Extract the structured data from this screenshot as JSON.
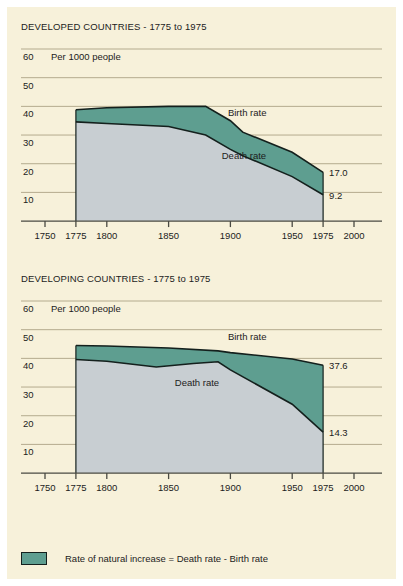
{
  "panel": {
    "background_color": "#f7f1da",
    "page_background_color": "#ffffff"
  },
  "colors": {
    "natural_increase_fill": "#5e9e90",
    "death_area_fill": "#c8ced2",
    "line": "#14201d",
    "gridline": "#b4ab8e",
    "axis": "#4a4a42",
    "text": "#1c1c1c"
  },
  "legend": {
    "swatch_name": "natural-increase-swatch",
    "text": "Rate of natural increase = Death rate - Birth rate"
  },
  "charts": [
    {
      "id": "developed",
      "title": "DEVELOPED COUNTRIES - 1775 to 1975",
      "unit_label": "Per 1000 people",
      "birth_label": "Birth rate",
      "death_label": "Death rate",
      "end_label_birth": "17.0",
      "end_label_death": "9.2",
      "y_ticks": [
        60,
        50,
        40,
        30,
        20,
        10
      ],
      "x_ticks": [
        1750,
        1775,
        1800,
        1850,
        1900,
        1950,
        1975,
        2000
      ],
      "xlim": [
        1750,
        2000
      ],
      "ylim": [
        0,
        63
      ],
      "series": [
        {
          "name": "Birth rate",
          "points": [
            [
              1775,
              38.8
            ],
            [
              1800,
              39.5
            ],
            [
              1850,
              40.0
            ],
            [
              1880,
              40.0
            ],
            [
              1900,
              35.0
            ],
            [
              1910,
              31.0
            ],
            [
              1950,
              24.0
            ],
            [
              1975,
              17.0
            ]
          ]
        },
        {
          "name": "Death rate",
          "points": [
            [
              1775,
              34.6
            ],
            [
              1800,
              34.0
            ],
            [
              1850,
              33.0
            ],
            [
              1880,
              30.0
            ],
            [
              1900,
              25.0
            ],
            [
              1910,
              22.8
            ],
            [
              1950,
              15.5
            ],
            [
              1975,
              9.2
            ]
          ]
        }
      ]
    },
    {
      "id": "developing",
      "title": "DEVELOPING COUNTRIES - 1775 to 1975",
      "unit_label": "Per 1000 people",
      "birth_label": "Birth rate",
      "death_label": "Death rate",
      "end_label_birth": "37.6",
      "end_label_death": "14.3",
      "y_ticks": [
        60,
        50,
        40,
        30,
        20,
        10
      ],
      "x_ticks": [
        1750,
        1775,
        1800,
        1850,
        1900,
        1950,
        1975,
        2000
      ],
      "xlim": [
        1750,
        2000
      ],
      "ylim": [
        0,
        63
      ],
      "series": [
        {
          "name": "Birth rate",
          "points": [
            [
              1775,
              44.5
            ],
            [
              1800,
              44.3
            ],
            [
              1850,
              43.6
            ],
            [
              1890,
              42.6
            ],
            [
              1900,
              42.0
            ],
            [
              1950,
              39.8
            ],
            [
              1975,
              37.6
            ]
          ]
        },
        {
          "name": "Death rate",
          "points": [
            [
              1775,
              39.6
            ],
            [
              1800,
              39.0
            ],
            [
              1840,
              37.0
            ],
            [
              1870,
              38.2
            ],
            [
              1890,
              38.8
            ],
            [
              1900,
              36.0
            ],
            [
              1950,
              24.0
            ],
            [
              1975,
              14.3
            ]
          ]
        }
      ]
    }
  ],
  "chart_data": {
    "type": "area",
    "ylabel": "Per 1000 people",
    "xlabel": "",
    "xlim": [
      1750,
      2000
    ],
    "ylim": [
      0,
      63
    ],
    "grid": true,
    "legend": "Rate of natural increase = Death rate - Birth rate",
    "panels": [
      {
        "title": "DEVELOPED COUNTRIES - 1775 to 1975",
        "x": [
          1775,
          1800,
          1850,
          1880,
          1900,
          1910,
          1950,
          1975
        ],
        "series": [
          {
            "name": "Birth rate",
            "values": [
              38.8,
              39.5,
              40.0,
              40.0,
              35.0,
              31.0,
              24.0,
              17.0
            ],
            "end_value": 17.0
          },
          {
            "name": "Death rate",
            "values": [
              34.6,
              34.0,
              33.0,
              30.0,
              25.0,
              22.8,
              15.5,
              9.2
            ],
            "end_value": 9.2
          }
        ]
      },
      {
        "title": "DEVELOPING COUNTRIES - 1775 to 1975",
        "x": [
          1775,
          1800,
          1840,
          1850,
          1870,
          1890,
          1900,
          1950,
          1975
        ],
        "series": [
          {
            "name": "Birth rate",
            "values": [
              44.5,
              44.3,
              43.9,
              43.6,
              43.1,
              42.6,
              42.0,
              39.8,
              37.6
            ],
            "end_value": 37.6
          },
          {
            "name": "Death rate",
            "values": [
              39.6,
              39.0,
              37.0,
              37.3,
              38.2,
              38.8,
              36.0,
              24.0,
              14.3
            ],
            "end_value": 14.3
          }
        ]
      }
    ]
  }
}
